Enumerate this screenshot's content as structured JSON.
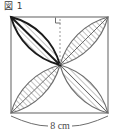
{
  "figure": {
    "label": "図 1",
    "shape_name": "square-with-four-petals",
    "square": {
      "side_label": "8 cm",
      "side_value": 8,
      "side_unit": "cm"
    },
    "annotations": {
      "right_angle_mark": "right-angle",
      "center_line_style": "dashed",
      "dimension_label": "8 cm"
    },
    "petals": [
      {
        "position": "top-left",
        "emphasis": "bold",
        "hatched": true
      },
      {
        "position": "top-right",
        "emphasis": "normal",
        "hatched": true
      },
      {
        "position": "bottom-left",
        "emphasis": "normal",
        "hatched": true
      },
      {
        "position": "bottom-right",
        "emphasis": "normal",
        "hatched": true
      }
    ],
    "colors": {
      "outline": "#6d6d6d",
      "bold_outline": "#1a1a1a",
      "hatch": "#8a8a8a",
      "dimension": "#6d6d6d",
      "label_text": "#3a3a3a",
      "background": "#ffffff"
    }
  }
}
